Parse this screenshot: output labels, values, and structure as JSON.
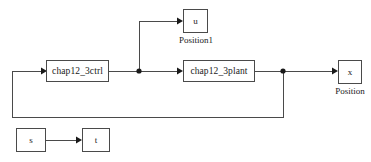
{
  "diagram": {
    "type": "simulink-block-diagram",
    "width": 371,
    "height": 162,
    "background_color": "#ffffff",
    "line_color": "#4a4a4a",
    "text_color": "#1a1a1a",
    "blocks": [
      {
        "id": "ctrl",
        "label": "chap12_3ctrl",
        "kind": "subsystem",
        "x": 46,
        "y": 60,
        "w": 63,
        "h": 22
      },
      {
        "id": "plant",
        "label": "chap12_3plant",
        "kind": "subsystem",
        "x": 183,
        "y": 60,
        "w": 72,
        "h": 22
      },
      {
        "id": "scope_u",
        "label": "u",
        "kind": "scope",
        "caption": "Position1",
        "x": 183,
        "y": 9,
        "w": 25,
        "h": 24
      },
      {
        "id": "scope_x",
        "label": "x",
        "kind": "scope",
        "caption": "Position",
        "x": 338,
        "y": 60,
        "w": 24,
        "h": 24
      },
      {
        "id": "src_s",
        "label": "s",
        "kind": "source",
        "x": 16,
        "y": 128,
        "w": 30,
        "h": 24
      },
      {
        "id": "sink_t",
        "label": "t",
        "kind": "sink",
        "x": 82,
        "y": 128,
        "w": 28,
        "h": 24
      }
    ],
    "captions": [
      {
        "id": "caption_position1",
        "text": "Position1",
        "x": 152,
        "y": 35,
        "w": 88
      },
      {
        "id": "caption_position",
        "text": "Position",
        "x": 316,
        "y": 86,
        "w": 68
      }
    ],
    "junctions": [
      {
        "id": "junction-u-branch",
        "x": 139,
        "y": 71
      },
      {
        "id": "junction-x-feedback",
        "x": 283,
        "y": 71
      }
    ],
    "signals": [
      {
        "id": "ctrl-to-branch",
        "from": "ctrl",
        "to": "junction-u-branch"
      },
      {
        "id": "branch-to-plant",
        "from": "junction-u-branch",
        "to": "plant"
      },
      {
        "id": "branch-to-scope-u",
        "from": "junction-u-branch",
        "to": "scope_u"
      },
      {
        "id": "plant-to-junction",
        "from": "plant",
        "to": "junction-x-feedback"
      },
      {
        "id": "junction-to-scope-x",
        "from": "junction-x-feedback",
        "to": "scope_x"
      },
      {
        "id": "feedback-loop",
        "from": "junction-x-feedback",
        "to": "ctrl"
      },
      {
        "id": "s-to-t",
        "from": "src_s",
        "to": "sink_t"
      }
    ]
  }
}
